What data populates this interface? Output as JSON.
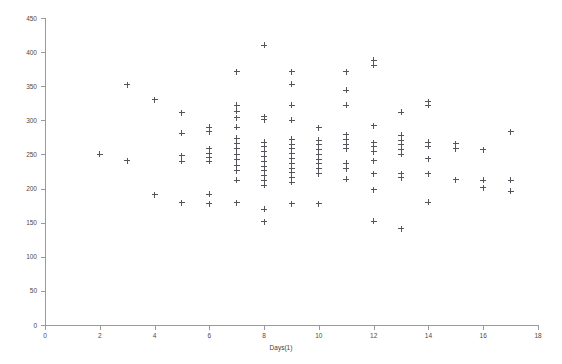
{
  "chart_data": {
    "type": "scatter",
    "title": "",
    "xlabel": "Days(1)",
    "ylabel": "Amount(1)",
    "xlim": [
      0,
      18
    ],
    "ylim": [
      0,
      450
    ],
    "xticks": [
      0,
      2,
      4,
      6,
      8,
      10,
      12,
      14,
      16,
      18
    ],
    "yticks": [
      0,
      50,
      100,
      150,
      200,
      250,
      300,
      350,
      400,
      450
    ],
    "grid": false,
    "legend": null,
    "marker": "+",
    "marker_color": "#55555b",
    "axis_color": "#9a9a9a",
    "background": "#ffffff",
    "series": [
      {
        "name": "observations",
        "points": [
          [
            2,
            250
          ],
          [
            3,
            352
          ],
          [
            3,
            241
          ],
          [
            4,
            330
          ],
          [
            4,
            191
          ],
          [
            5,
            311
          ],
          [
            5,
            281
          ],
          [
            5,
            248
          ],
          [
            5,
            240
          ],
          [
            5,
            179
          ],
          [
            6,
            290
          ],
          [
            6,
            283
          ],
          [
            6,
            258
          ],
          [
            6,
            252
          ],
          [
            6,
            245
          ],
          [
            6,
            240
          ],
          [
            6,
            192
          ],
          [
            6,
            178
          ],
          [
            7,
            371
          ],
          [
            7,
            322
          ],
          [
            7,
            313
          ],
          [
            7,
            304
          ],
          [
            7,
            290
          ],
          [
            7,
            274
          ],
          [
            7,
            266
          ],
          [
            7,
            258
          ],
          [
            7,
            250
          ],
          [
            7,
            242
          ],
          [
            7,
            234
          ],
          [
            7,
            226
          ],
          [
            7,
            212
          ],
          [
            7,
            179
          ],
          [
            8,
            410
          ],
          [
            8,
            305
          ],
          [
            8,
            301
          ],
          [
            8,
            268
          ],
          [
            8,
            261
          ],
          [
            8,
            254
          ],
          [
            8,
            247
          ],
          [
            8,
            240
          ],
          [
            8,
            233
          ],
          [
            8,
            226
          ],
          [
            8,
            219
          ],
          [
            8,
            212
          ],
          [
            8,
            205
          ],
          [
            8,
            170
          ],
          [
            8,
            151
          ],
          [
            9,
            371
          ],
          [
            9,
            353
          ],
          [
            9,
            322
          ],
          [
            9,
            300
          ],
          [
            9,
            272
          ],
          [
            9,
            265
          ],
          [
            9,
            258
          ],
          [
            9,
            251
          ],
          [
            9,
            244
          ],
          [
            9,
            237
          ],
          [
            9,
            230
          ],
          [
            9,
            223
          ],
          [
            9,
            216
          ],
          [
            9,
            209
          ],
          [
            9,
            178
          ],
          [
            10,
            289
          ],
          [
            10,
            271
          ],
          [
            10,
            264
          ],
          [
            10,
            257
          ],
          [
            10,
            250
          ],
          [
            10,
            243
          ],
          [
            10,
            236
          ],
          [
            10,
            229
          ],
          [
            10,
            222
          ],
          [
            10,
            178
          ],
          [
            11,
            371
          ],
          [
            11,
            344
          ],
          [
            11,
            322
          ],
          [
            11,
            279
          ],
          [
            11,
            272
          ],
          [
            11,
            265
          ],
          [
            11,
            258
          ],
          [
            11,
            237
          ],
          [
            11,
            229
          ],
          [
            11,
            214
          ],
          [
            12,
            388
          ],
          [
            12,
            381
          ],
          [
            12,
            292
          ],
          [
            12,
            267
          ],
          [
            12,
            261
          ],
          [
            12,
            254
          ],
          [
            12,
            241
          ],
          [
            12,
            222
          ],
          [
            12,
            198
          ],
          [
            12,
            152
          ],
          [
            13,
            312
          ],
          [
            13,
            278
          ],
          [
            13,
            271
          ],
          [
            13,
            264
          ],
          [
            13,
            257
          ],
          [
            13,
            250
          ],
          [
            13,
            222
          ],
          [
            13,
            216
          ],
          [
            13,
            141
          ],
          [
            14,
            327
          ],
          [
            14,
            322
          ],
          [
            14,
            268
          ],
          [
            14,
            262
          ],
          [
            14,
            244
          ],
          [
            14,
            222
          ],
          [
            14,
            180
          ],
          [
            15,
            266
          ],
          [
            15,
            258
          ],
          [
            15,
            213
          ],
          [
            16,
            257
          ],
          [
            16,
            212
          ],
          [
            16,
            201
          ],
          [
            17,
            283
          ],
          [
            17,
            212
          ],
          [
            17,
            196
          ]
        ]
      }
    ]
  },
  "axes": {
    "y_title": "Amount(1)",
    "x_title": "Days(1)",
    "y_tick_labels": [
      "0",
      "50",
      "100",
      "150",
      "200",
      "250",
      "300",
      "350",
      "400",
      "450"
    ],
    "x_tick_labels": [
      "0",
      "2",
      "4",
      "6",
      "8",
      "10",
      "12",
      "14",
      "16",
      "18"
    ]
  }
}
